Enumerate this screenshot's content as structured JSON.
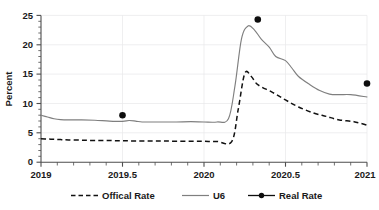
{
  "chart_data": {
    "type": "line",
    "title": "",
    "xlabel": "",
    "ylabel": "Percent",
    "xlim": [
      2019,
      2021
    ],
    "ylim": [
      0,
      25
    ],
    "grid": true,
    "legend_position": "bottom",
    "x_ticks": [
      "2019",
      "2019.5",
      "2020",
      "2020.5",
      "2021"
    ],
    "x_tick_values": [
      2019,
      2019.5,
      2020,
      2020.5,
      2021
    ],
    "x_minor_per_interval": 5,
    "y_ticks": [
      "0",
      "5",
      "10",
      "15",
      "20",
      "25"
    ],
    "y_tick_values": [
      0,
      5,
      10,
      15,
      20,
      25
    ],
    "y_minor_per_interval": 5,
    "series": [
      {
        "name": "Offical Rate",
        "style": "dashed",
        "color": "#111111",
        "x": [
          2019.0,
          2019.04,
          2019.08,
          2019.12,
          2019.17,
          2019.25,
          2019.33,
          2019.42,
          2019.5,
          2019.58,
          2019.67,
          2019.75,
          2019.83,
          2019.92,
          2020.0,
          2020.08,
          2020.17,
          2020.21,
          2020.25,
          2020.29,
          2020.33,
          2020.42,
          2020.5,
          2020.58,
          2020.67,
          2020.75,
          2020.83,
          2020.92,
          2021.0
        ],
        "values": [
          4.0,
          3.95,
          3.9,
          3.85,
          3.8,
          3.75,
          3.7,
          3.68,
          3.65,
          3.62,
          3.6,
          3.6,
          3.58,
          3.55,
          3.55,
          3.53,
          3.5,
          9.0,
          15.1,
          14.6,
          13.2,
          11.9,
          10.6,
          9.4,
          8.4,
          7.8,
          7.2,
          6.9,
          6.3
        ]
      },
      {
        "name": "U6",
        "style": "solid",
        "color": "#7f7f7f",
        "x": [
          2019.0,
          2019.04,
          2019.08,
          2019.12,
          2019.17,
          2019.25,
          2019.33,
          2019.42,
          2019.5,
          2019.54,
          2019.58,
          2019.62,
          2019.67,
          2019.75,
          2019.83,
          2019.92,
          2020.0,
          2020.08,
          2020.15,
          2020.19,
          2020.23,
          2020.27,
          2020.31,
          2020.35,
          2020.4,
          2020.44,
          2020.5,
          2020.54,
          2020.58,
          2020.65,
          2020.71,
          2020.77,
          2020.83,
          2020.9,
          2021.0
        ],
        "values": [
          8.0,
          7.7,
          7.4,
          7.25,
          7.2,
          7.2,
          7.15,
          7.0,
          6.95,
          7.1,
          7.0,
          6.85,
          6.85,
          6.85,
          6.85,
          6.9,
          6.85,
          6.85,
          7.4,
          13.0,
          21.0,
          23.2,
          22.5,
          21.0,
          19.6,
          18.0,
          17.3,
          16.0,
          14.6,
          13.2,
          12.2,
          11.6,
          11.5,
          11.5,
          11.1
        ]
      },
      {
        "name": "Real Rate",
        "style": "markers",
        "color": "#0d0d0d",
        "x": [
          2019.5,
          2020.33,
          2021.0
        ],
        "values": [
          8.0,
          24.3,
          13.4
        ]
      }
    ],
    "legend": [
      {
        "label": "Offical Rate",
        "marker": "dashed-line"
      },
      {
        "label": "U6",
        "marker": "solid-line"
      },
      {
        "label": "Real Rate",
        "marker": "line-with-dot"
      }
    ]
  }
}
